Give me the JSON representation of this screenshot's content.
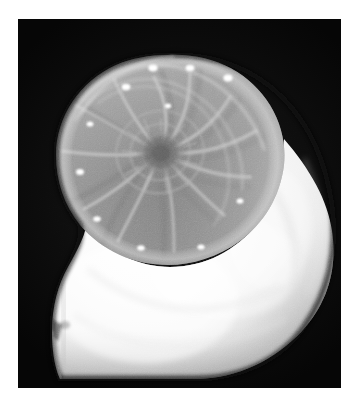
{
  "image": {
    "kind": "photograph",
    "subject": "nautilus-shell-cross-section",
    "title": "Nautilus shell sagittal cross-section",
    "orientation": "portrait",
    "color_mode": "grayscale",
    "canvas": {
      "width": 359,
      "height": 412
    },
    "margin": {
      "color": "#ffffff",
      "left": 18,
      "top": 19,
      "right": 18,
      "bottom": 24
    },
    "plate": {
      "label": "photo-plate",
      "x": 18,
      "y": 19,
      "width": 323,
      "height": 369,
      "background_color": "#050505"
    }
  },
  "palette": {
    "background_white": "#ffffff",
    "plate_black": "#050505",
    "body_chamber_white": "#fbfbfb",
    "body_chamber_highlight": "#ffffff",
    "body_chamber_shade": "#d8d8d8",
    "chamber_gray_light": "#b6b6b6",
    "chamber_gray_mid": "#8d8d8d",
    "chamber_gray_dark": "#6a6a6a",
    "septa_line": "#c9c9c9",
    "core_dark": "#5a5a5a",
    "rim_glow": "#e9e9e9",
    "edge_shadow": "#1a1a1a"
  },
  "shell": {
    "label": "nautilus-shell",
    "spiral_center": {
      "x": 142,
      "y": 133
    },
    "spiral_direction": "counterclockwise",
    "regions": [
      {
        "name": "phragmocone",
        "description": "chambered spiral region, mid gray, upper-left",
        "tone": "#8d8d8d"
      },
      {
        "name": "body-chamber",
        "description": "large bright living chamber sweeping bottom and right",
        "tone": "#fbfbfb"
      },
      {
        "name": "aperture-lip",
        "description": "notched lower-left opening edge",
        "tone": "#e4e4e4"
      },
      {
        "name": "protoconch",
        "description": "dark finely textured innermost coil",
        "tone": "#5a5a5a"
      }
    ],
    "septa": {
      "label": "chamber-dividing-walls",
      "count": 14,
      "description": "logarithmic-spiral curved walls radiating from the core"
    },
    "siphuncle_dots": {
      "label": "bright-siphuncle-highlights",
      "count": 11,
      "color": "#ffffff",
      "points": [
        {
          "x": 108,
          "y": 68
        },
        {
          "x": 135,
          "y": 49
        },
        {
          "x": 172,
          "y": 49
        },
        {
          "x": 210,
          "y": 59
        },
        {
          "x": 72,
          "y": 105
        },
        {
          "x": 62,
          "y": 153
        },
        {
          "x": 79,
          "y": 200
        },
        {
          "x": 123,
          "y": 229
        },
        {
          "x": 183,
          "y": 228
        },
        {
          "x": 222,
          "y": 182
        },
        {
          "x": 150,
          "y": 87
        }
      ]
    },
    "outline": {
      "top_y": 36,
      "bottom_y": 360,
      "left_x": 38,
      "right_x": 316
    }
  }
}
